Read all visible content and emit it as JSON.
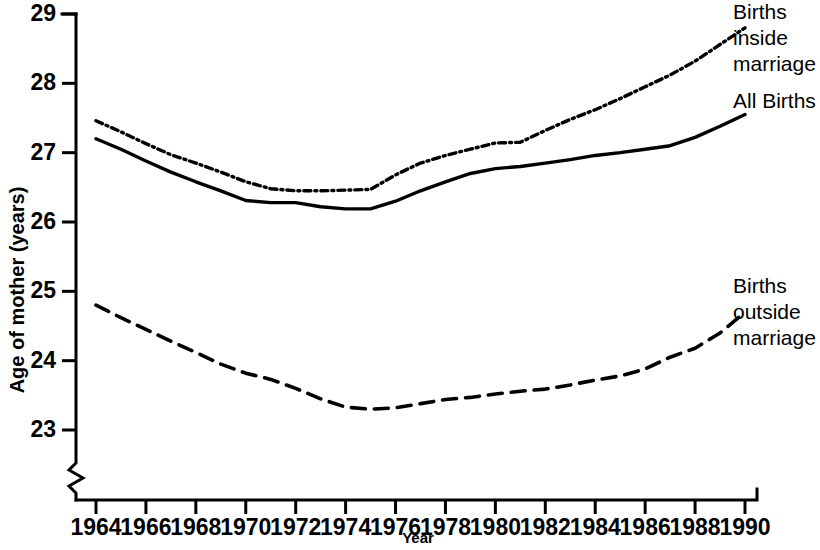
{
  "chart_data": {
    "type": "line",
    "title": "",
    "xlabel": "Year",
    "ylabel": "Age of mother (years)",
    "xlim": [
      1963,
      1990.5
    ],
    "ylim": [
      22.55,
      29
    ],
    "y_axis_break": true,
    "grid": false,
    "legend_position": "inline-right-annotations",
    "xticks": [
      1964,
      1966,
      1968,
      1970,
      1972,
      1974,
      1976,
      1978,
      1980,
      1982,
      1984,
      1986,
      1988,
      1990
    ],
    "xtick_labels": [
      "1964",
      "1966",
      "1968",
      "1970",
      "1972",
      "1974",
      "1976",
      "1978",
      "1980",
      "1982",
      "1984",
      "1986",
      "1988",
      "1990"
    ],
    "yticks": [
      23,
      24,
      25,
      26,
      27,
      28,
      29
    ],
    "ytick_labels": [
      "23",
      "24",
      "25",
      "26",
      "27",
      "28",
      "29"
    ],
    "x": [
      1964,
      1965,
      1966,
      1967,
      1968,
      1969,
      1970,
      1971,
      1972,
      1973,
      1974,
      1975,
      1976,
      1977,
      1978,
      1979,
      1980,
      1981,
      1982,
      1983,
      1984,
      1985,
      1986,
      1987,
      1988,
      1989,
      1990
    ],
    "series": [
      {
        "name": "Births inside marriage",
        "style": "dash-dot",
        "values": [
          27.46,
          27.3,
          27.13,
          26.97,
          26.85,
          26.72,
          26.58,
          26.48,
          26.45,
          26.45,
          26.46,
          26.47,
          26.68,
          26.85,
          26.96,
          27.05,
          27.14,
          27.15,
          27.32,
          27.48,
          27.62,
          27.78,
          27.95,
          28.12,
          28.32,
          28.56,
          28.8
        ]
      },
      {
        "name": "All Births",
        "style": "solid",
        "values": [
          27.2,
          27.05,
          26.88,
          26.72,
          26.58,
          26.45,
          26.31,
          26.28,
          26.28,
          26.22,
          26.19,
          26.19,
          26.3,
          26.45,
          26.58,
          26.7,
          26.77,
          26.8,
          26.85,
          26.9,
          26.96,
          27.0,
          27.05,
          27.1,
          27.22,
          27.38,
          27.55
        ]
      },
      {
        "name": "Births outside marriage",
        "style": "dashed",
        "values": [
          24.8,
          24.62,
          24.45,
          24.28,
          24.12,
          23.95,
          23.82,
          23.73,
          23.6,
          23.45,
          23.33,
          23.3,
          23.32,
          23.38,
          23.44,
          23.47,
          23.52,
          23.56,
          23.59,
          23.65,
          23.72,
          23.78,
          23.88,
          24.05,
          24.18,
          24.4,
          24.7
        ]
      }
    ],
    "annotations": [
      {
        "name": "births-inside-marriage",
        "lines": [
          "Births",
          "inside",
          "marriage"
        ],
        "x": 733,
        "y": 4
      },
      {
        "name": "all-births",
        "lines": [
          "All Births"
        ],
        "x": 733,
        "y": 93
      },
      {
        "name": "births-outside-marriage",
        "lines": [
          "Births",
          "outside",
          "marriage"
        ],
        "x": 733,
        "y": 278
      }
    ]
  }
}
